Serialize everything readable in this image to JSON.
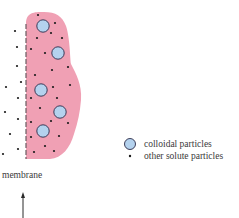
{
  "diagram": {
    "colors": {
      "compartment_fill": "#f0a0b4",
      "colloid_fill": "#b4d2ee",
      "colloid_stroke": "#2a2a48",
      "solute_dot": "#1a1a1a",
      "membrane": "#6a5a60",
      "text": "#3a3a3a"
    },
    "membrane_label": "membrane",
    "legend": {
      "items": [
        {
          "icon": "colloid-circle-icon",
          "label": "colloidal particles"
        },
        {
          "icon": "solute-dot-icon",
          "label": "other solute particles"
        }
      ]
    },
    "colloidal_particles": [
      {
        "x": 43,
        "y": 26
      },
      {
        "x": 58,
        "y": 53
      },
      {
        "x": 41,
        "y": 90
      },
      {
        "x": 60,
        "y": 112
      },
      {
        "x": 43,
        "y": 131
      }
    ],
    "solute_particles_inside": [
      {
        "x": 38,
        "y": 15
      },
      {
        "x": 55,
        "y": 23
      },
      {
        "x": 51,
        "y": 33
      },
      {
        "x": 37,
        "y": 38
      },
      {
        "x": 62,
        "y": 38
      },
      {
        "x": 31,
        "y": 49
      },
      {
        "x": 45,
        "y": 53
      },
      {
        "x": 52,
        "y": 70
      },
      {
        "x": 68,
        "y": 67
      },
      {
        "x": 35,
        "y": 75
      },
      {
        "x": 53,
        "y": 87
      },
      {
        "x": 70,
        "y": 85
      },
      {
        "x": 31,
        "y": 98
      },
      {
        "x": 57,
        "y": 98
      },
      {
        "x": 40,
        "y": 108
      },
      {
        "x": 31,
        "y": 122
      },
      {
        "x": 51,
        "y": 121
      },
      {
        "x": 68,
        "y": 123
      },
      {
        "x": 31,
        "y": 137
      },
      {
        "x": 59,
        "y": 136
      },
      {
        "x": 45,
        "y": 146
      },
      {
        "x": 34,
        "y": 152
      },
      {
        "x": 54,
        "y": 151
      }
    ],
    "solute_particles_outside": [
      {
        "x": 15,
        "y": 31
      },
      {
        "x": 17,
        "y": 47
      },
      {
        "x": 17,
        "y": 66
      },
      {
        "x": 21,
        "y": 82
      },
      {
        "x": 6,
        "y": 87
      },
      {
        "x": 18,
        "y": 98
      },
      {
        "x": 5,
        "y": 112
      },
      {
        "x": 18,
        "y": 119
      },
      {
        "x": 10,
        "y": 134
      },
      {
        "x": 18,
        "y": 149
      },
      {
        "x": 3,
        "y": 154
      }
    ]
  }
}
